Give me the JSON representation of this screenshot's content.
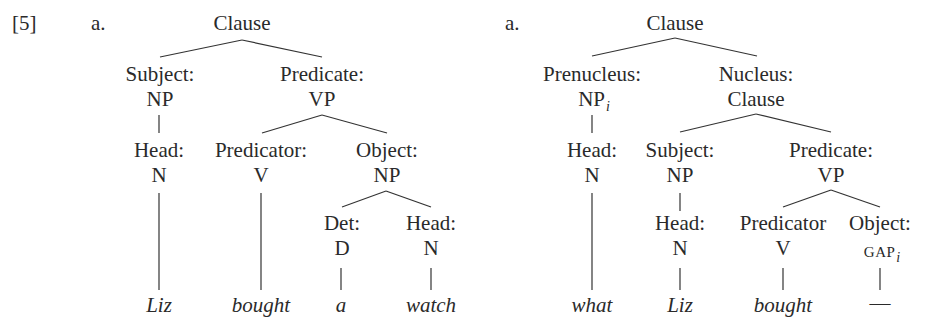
{
  "example_number": "[5]",
  "trees": {
    "a": {
      "label": "a.",
      "root": "Clause",
      "subject": {
        "func": "Subject:",
        "cat": "NP"
      },
      "predicate": {
        "func": "Predicate:",
        "cat": "VP"
      },
      "subject_head": {
        "func": "Head:",
        "cat": "N"
      },
      "predicator": {
        "func": "Predicator:",
        "cat": "V"
      },
      "object": {
        "func": "Object:",
        "cat": "NP"
      },
      "det": {
        "func": "Det:",
        "cat": "D"
      },
      "object_head": {
        "func": "Head:",
        "cat": "N"
      },
      "words": [
        "Liz",
        "bought",
        "a",
        "watch"
      ]
    },
    "b": {
      "label": "b.",
      "root": "Clause",
      "prenucleus": {
        "func": "Prenucleus:",
        "cat": "NP",
        "index": "i"
      },
      "nucleus": {
        "func": "Nucleus:",
        "cat": "Clause"
      },
      "prenucleus_head": {
        "func": "Head:",
        "cat": "N"
      },
      "subject": {
        "func": "Subject:",
        "cat": "NP"
      },
      "predicate": {
        "func": "Predicate:",
        "cat": "VP"
      },
      "subject_head": {
        "func": "Head:",
        "cat": "N"
      },
      "predicator": {
        "func": "Predicator",
        "cat": "V"
      },
      "object": {
        "func": "Object:",
        "cat": "GAP",
        "index": "i"
      },
      "words": [
        "what",
        "Liz",
        "bought",
        "—"
      ]
    }
  },
  "colors": {
    "ink": "#2a2a2a",
    "background": "#ffffff"
  }
}
